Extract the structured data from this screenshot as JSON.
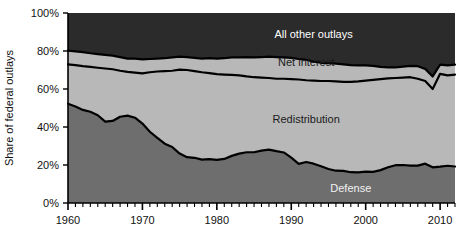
{
  "chart_data": {
    "type": "area",
    "stacked": true,
    "title": "",
    "xlabel": "",
    "ylabel": "Share of federal outlays",
    "xlim": [
      1960,
      2012
    ],
    "ylim": [
      0,
      100
    ],
    "xticks": [
      1960,
      1970,
      1980,
      1990,
      2000,
      2010
    ],
    "xtick_labels": [
      "1960",
      "1970",
      "1980",
      "1990",
      "2000",
      "2010"
    ],
    "yticks": [
      0,
      20,
      40,
      60,
      80,
      100
    ],
    "ytick_labels": [
      "0%",
      "20%",
      "40%",
      "60%",
      "80%",
      "100%"
    ],
    "minor_xtick_interval": 1,
    "grid": false,
    "legend": "inline-labels",
    "colors": {
      "defense": "#6e6e6e",
      "redistribution": "#b8b8b8",
      "net_interest": "#b8b8b8",
      "all_other_outlays": "#2b2b2b",
      "boundary_line": "#000000",
      "axis": "#000000",
      "background": "#ffffff"
    },
    "x": [
      1960,
      1961,
      1962,
      1963,
      1964,
      1965,
      1966,
      1967,
      1968,
      1969,
      1970,
      1971,
      1972,
      1973,
      1974,
      1975,
      1976,
      1977,
      1978,
      1979,
      1980,
      1981,
      1982,
      1983,
      1984,
      1985,
      1986,
      1987,
      1988,
      1989,
      1990,
      1991,
      1992,
      1993,
      1994,
      1995,
      1996,
      1997,
      1998,
      1999,
      2000,
      2001,
      2002,
      2003,
      2004,
      2005,
      2006,
      2007,
      2008,
      2009,
      2010,
      2011,
      2012
    ],
    "series": [
      {
        "name": "Defense",
        "label": "Defense",
        "label_x": 1998,
        "label_y": 8,
        "stack_order": 1,
        "values": [
          52.2,
          50.8,
          49.0,
          48.0,
          46.2,
          42.8,
          43.2,
          45.4,
          46.0,
          44.9,
          41.8,
          37.5,
          34.3,
          31.2,
          29.5,
          26.0,
          24.1,
          23.8,
          22.8,
          23.1,
          22.7,
          23.2,
          24.8,
          26.0,
          26.7,
          26.7,
          27.6,
          28.1,
          27.3,
          26.6,
          23.9,
          20.6,
          21.6,
          20.7,
          19.3,
          17.9,
          17.0,
          16.9,
          16.2,
          16.1,
          16.5,
          16.4,
          17.3,
          18.8,
          19.9,
          20.0,
          19.7,
          19.7,
          20.7,
          18.8,
          19.1,
          19.6,
          19.2
        ]
      },
      {
        "name": "Redistribution",
        "label": "Redistribution",
        "label_x": 1992,
        "label_y": 44,
        "stack_order": 2,
        "cumulative_top": [
          73.0,
          72.6,
          72.0,
          71.6,
          71.2,
          70.8,
          70.4,
          69.6,
          69.0,
          68.6,
          68.2,
          68.8,
          69.2,
          69.4,
          69.6,
          70.2,
          70.0,
          69.4,
          68.8,
          68.4,
          67.8,
          67.6,
          67.4,
          67.2,
          66.6,
          66.2,
          66.0,
          65.8,
          65.4,
          65.4,
          65.2,
          65.0,
          64.6,
          64.4,
          64.2,
          64.2,
          64.0,
          63.8,
          63.8,
          64.0,
          64.4,
          64.8,
          65.2,
          65.6,
          65.8,
          66.0,
          66.2,
          65.4,
          64.2,
          60.0,
          68.0,
          67.2,
          67.6
        ]
      },
      {
        "name": "Net interest",
        "label": "Net interest",
        "label_x": 1992,
        "label_y": 74,
        "stack_order": 3,
        "cumulative_top": [
          80.2,
          79.8,
          79.4,
          78.8,
          78.4,
          78.0,
          77.6,
          76.8,
          76.0,
          76.0,
          75.6,
          75.8,
          76.0,
          76.2,
          76.6,
          77.0,
          76.8,
          76.4,
          76.0,
          76.2,
          76.0,
          76.2,
          76.6,
          76.6,
          76.8,
          76.6,
          76.8,
          77.0,
          76.8,
          76.6,
          76.4,
          75.8,
          75.4,
          74.4,
          73.8,
          73.6,
          73.4,
          73.0,
          72.6,
          72.4,
          72.4,
          72.2,
          71.6,
          71.4,
          71.4,
          71.8,
          72.2,
          72.0,
          70.6,
          66.6,
          72.8,
          72.4,
          72.8
        ]
      },
      {
        "name": "All other outlays",
        "label": "All other outlays",
        "label_x": 1993,
        "label_y": 89,
        "stack_order": 4,
        "cumulative_top": [
          100,
          100,
          100,
          100,
          100,
          100,
          100,
          100,
          100,
          100,
          100,
          100,
          100,
          100,
          100,
          100,
          100,
          100,
          100,
          100,
          100,
          100,
          100,
          100,
          100,
          100,
          100,
          100,
          100,
          100,
          100,
          100,
          100,
          100,
          100,
          100,
          100,
          100,
          100,
          100,
          100,
          100,
          100,
          100,
          100,
          100,
          100,
          100,
          100,
          100,
          100,
          100,
          100
        ]
      }
    ]
  },
  "axes": {
    "y_axis_title": "Share of federal outlays"
  }
}
